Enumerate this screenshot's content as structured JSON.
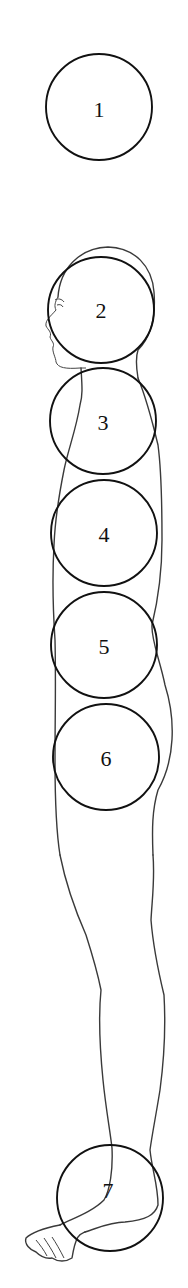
{
  "diagram": {
    "figure": "human-profile-outline",
    "circles": [
      {
        "label": "1",
        "cx": 99,
        "cy": 107,
        "r": 53
      },
      {
        "label": "2",
        "cx": 101,
        "cy": 310,
        "r": 53
      },
      {
        "label": "3",
        "cx": 103,
        "cy": 421,
        "r": 53
      },
      {
        "label": "4",
        "cx": 104,
        "cy": 533,
        "r": 53
      },
      {
        "label": "5",
        "cx": 104,
        "cy": 645,
        "r": 53
      },
      {
        "label": "6",
        "cx": 106,
        "cy": 757,
        "r": 53
      },
      {
        "label": "7",
        "cx": 110,
        "cy": 1198,
        "r": 53
      }
    ],
    "colors": {
      "background": "#ffffff",
      "circle_stroke": "#111111",
      "figure_stroke": "#3a3a3a"
    }
  }
}
